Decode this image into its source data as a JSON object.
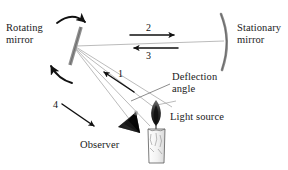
{
  "figure": {
    "background_color": "#ffffff",
    "ray_color": "#9a9a9a",
    "ink_color": "#1a1a1a",
    "mirror_color": "#8c8c8c"
  },
  "labels": {
    "rotating_mirror": "Rotating\nmirror",
    "stationary_mirror": "Stationary\nmirror",
    "deflection_angle": "Deflection\nangle",
    "observer": "Observer",
    "light_source": "Light source"
  },
  "ray_numbers": {
    "one": "1",
    "two": "2",
    "three": "3",
    "four": "4"
  },
  "icons": {
    "rotating_mirror": "mirror-bar-icon",
    "stationary_mirror": "curved-mirror-icon",
    "observer": "observer-eye-icon",
    "light_source": "candle-icon",
    "rotation_top": "rotation-arrow-clockwise-icon",
    "rotation_bottom": "rotation-arrow-counterclockwise-icon"
  }
}
